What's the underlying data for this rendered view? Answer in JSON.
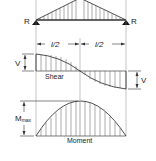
{
  "diagram": {
    "type": "beam-load-shear-moment",
    "colors": {
      "stroke": "#222222",
      "hatch": "#444444",
      "guide": "#888888",
      "background": "#ffffff"
    },
    "beam": {
      "support_left_label": "R",
      "support_right_label": "R",
      "load": "triangular, peak at midspan"
    },
    "dimensions": {
      "left_half_label": "l/2",
      "right_half_label": "l/2"
    },
    "shear": {
      "label": "Shear",
      "left_value_label": "V",
      "right_value_label": "V"
    },
    "moment": {
      "label": "Moment",
      "max_label_main": "M",
      "max_label_sub": "max"
    }
  }
}
